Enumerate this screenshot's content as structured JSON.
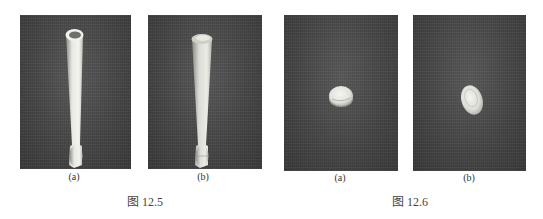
{
  "figures": [
    {
      "label": "图 12.5",
      "panels": [
        {
          "caption": "(a)",
          "subject": "tensile specimen rod with cup-shaped (ductile) fracture end"
        },
        {
          "caption": "(b)",
          "subject": "tensile specimen rod with flat rough (brittle) fracture end"
        }
      ]
    },
    {
      "label": "图 12.6",
      "panels": [
        {
          "caption": "(a)",
          "subject": "round fracture surface viewed end-on"
        },
        {
          "caption": "(b)",
          "subject": "oval fracture surface viewed end-on"
        }
      ]
    }
  ],
  "colors": {
    "photo_background": "#4a4a4a",
    "specimen": "#e6e6e0",
    "text": "#333333"
  }
}
